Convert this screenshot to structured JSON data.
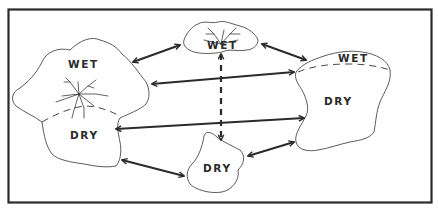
{
  "diagram": {
    "type": "habitat-connectivity",
    "frame": {
      "x": 8,
      "y": 9,
      "width": 424,
      "height": 194
    },
    "patches": [
      {
        "id": "left",
        "labels": [
          "WET",
          "DRY"
        ],
        "has_wet_dry_boundary": true,
        "has_drainage_network": true
      },
      {
        "id": "top",
        "labels": [
          "WET"
        ],
        "has_wet_dry_boundary": false,
        "has_drainage_network": true
      },
      {
        "id": "right",
        "labels": [
          "WET",
          "DRY"
        ],
        "has_wet_dry_boundary": true,
        "has_drainage_network": false
      },
      {
        "id": "bottom",
        "labels": [
          "DRY"
        ],
        "has_wet_dry_boundary": false,
        "has_drainage_network": false
      }
    ],
    "connections": [
      {
        "from": "left",
        "to": "top",
        "style": "solid",
        "direction": "bidirectional"
      },
      {
        "from": "top",
        "to": "right",
        "style": "solid",
        "direction": "bidirectional"
      },
      {
        "from": "left",
        "to": "right",
        "style": "solid",
        "direction": "bidirectional",
        "note": "upper link"
      },
      {
        "from": "left",
        "to": "right",
        "style": "solid",
        "direction": "bidirectional",
        "note": "lower link"
      },
      {
        "from": "left",
        "to": "bottom",
        "style": "solid",
        "direction": "bidirectional"
      },
      {
        "from": "bottom",
        "to": "right",
        "style": "solid",
        "direction": "bidirectional"
      },
      {
        "from": "top",
        "to": "bottom",
        "style": "dashed",
        "direction": "bidirectional"
      }
    ]
  },
  "labels": {
    "left_wet": "WET",
    "left_dry": "DRY",
    "top_wet": "WET",
    "right_wet": "WET",
    "right_dry": "DRY",
    "bottom_dry": "DRY"
  },
  "colors": {
    "ink": "#2a2a2a",
    "background": "#ffffff"
  }
}
